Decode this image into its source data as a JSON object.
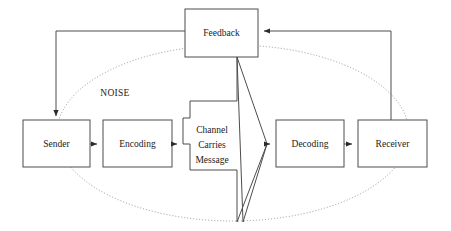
{
  "diagram": {
    "background_color": "#ffffff",
    "box_stroke_color": "#4d4d4d",
    "line_color": "#4d4d4d",
    "noise_ellipse_color": "#8a8a8a",
    "text_color": "#1a1a1a",
    "nodes": [
      {
        "id": "sender",
        "label": "Sender",
        "shape": "rectangle"
      },
      {
        "id": "encoding",
        "label": "Encoding",
        "shape": "rectangle"
      },
      {
        "id": "channel",
        "label_line1": "Channel",
        "label_line2": "Carries",
        "label_line3": "Message",
        "shape": "polygon"
      },
      {
        "id": "decoding",
        "label": "Decoding",
        "shape": "rectangle"
      },
      {
        "id": "receiver",
        "label": "Receiver",
        "shape": "rectangle"
      },
      {
        "id": "feedback",
        "label": "Feedback",
        "shape": "rectangle"
      }
    ],
    "annotations": [
      {
        "id": "noise",
        "label": "NOISE",
        "shape": "dotted-ellipse"
      }
    ],
    "edges": [
      {
        "from": "sender",
        "to": "encoding",
        "style": "solid-arrow"
      },
      {
        "from": "encoding",
        "to": "channel",
        "style": "solid-arrow"
      },
      {
        "from": "channel",
        "to": "decoding",
        "style": "solid-arrow"
      },
      {
        "from": "decoding",
        "to": "receiver",
        "style": "solid-arrow"
      },
      {
        "from": "receiver",
        "to": "feedback",
        "style": "solid-arrow"
      },
      {
        "from": "feedback",
        "to": "sender",
        "style": "solid-arrow"
      }
    ]
  }
}
